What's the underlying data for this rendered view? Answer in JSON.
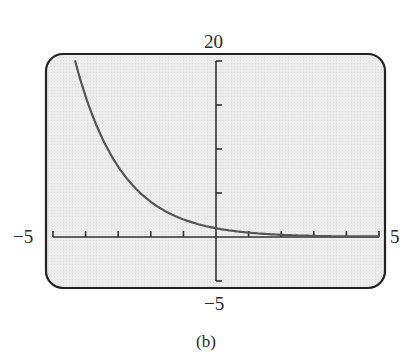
{
  "chart_data": {
    "type": "line",
    "title": "",
    "caption": "(b)",
    "function": "f(x) = 2^(-x)",
    "xlabel": "",
    "ylabel": "",
    "xlim": [
      -5,
      5
    ],
    "ylim": [
      -5,
      20
    ],
    "window_labels": {
      "xmin": "−5",
      "xmax": "5",
      "ymin": "−5",
      "ymax": "20"
    },
    "x_ticks": [
      -5,
      -4,
      -3,
      -2,
      -1,
      0,
      1,
      2,
      3,
      4,
      5
    ],
    "y_ticks": [
      -5,
      0,
      5,
      10,
      15,
      20
    ],
    "grid": false,
    "legend": null,
    "series": [
      {
        "name": "f(x)",
        "x": [
          -4.32,
          -4,
          -3.5,
          -3,
          -2.5,
          -2,
          -1.5,
          -1,
          -0.5,
          0,
          0.5,
          1,
          1.5,
          2,
          2.5,
          3,
          3.5,
          4,
          4.5,
          5
        ],
        "values": [
          20.0,
          16.0,
          11.31,
          8.0,
          5.66,
          4.0,
          2.83,
          2.0,
          1.41,
          1.0,
          0.71,
          0.5,
          0.35,
          0.25,
          0.18,
          0.13,
          0.09,
          0.06,
          0.04,
          0.03
        ]
      }
    ],
    "colors": {
      "screen": "#ebebeb",
      "frame": "#222222",
      "axis": "#333333",
      "curve": "#555555"
    }
  }
}
